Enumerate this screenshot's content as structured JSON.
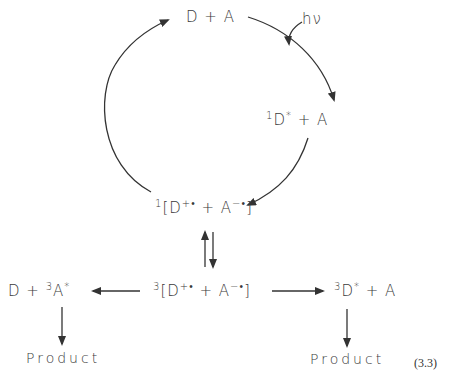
{
  "figure": {
    "equation_number": "(3.3)",
    "species": {
      "ground": {
        "main": "D + A"
      },
      "singlet_excited": {
        "pre": "1",
        "main": "D",
        "post": "*",
        "rest": " + A"
      },
      "singlet_rip": {
        "pre": "1",
        "open": "[D",
        "cation": "+•",
        "mid": " + A",
        "anion": "−•",
        "close": "]"
      },
      "triplet_rip": {
        "pre": "3",
        "open": "[D",
        "cation": "+•",
        "mid": " + A",
        "anion": "−•",
        "close": "]"
      },
      "triplet_acceptor": {
        "lead": "D + ",
        "pre": "3",
        "main": "A",
        "post": "*"
      },
      "triplet_donor": {
        "pre": "3",
        "main": "D",
        "post": "*",
        "rest": " + A"
      },
      "product_left": "Product",
      "product_right": "Product"
    },
    "labels": {
      "photon": "hν"
    },
    "arrows": [
      {
        "from": "D + A",
        "to": "1D* + A",
        "label": "hν",
        "style": "curved"
      },
      {
        "from": "1D* + A",
        "to": "1[D+• + A−•]",
        "style": "curved"
      },
      {
        "from": "1[D+• + A−•]",
        "to": "D + A",
        "style": "curved"
      },
      {
        "from": "1[D+• + A−•]",
        "to": "3[D+• + A−•]",
        "style": "equilibrium"
      },
      {
        "from": "3[D+• + A−•]",
        "to": "D + 3A*",
        "style": "straight"
      },
      {
        "from": "3[D+• + A−•]",
        "to": "3D* + A",
        "style": "straight"
      },
      {
        "from": "D + 3A*",
        "to": "Product",
        "style": "straight"
      },
      {
        "from": "3D* + A",
        "to": "Product",
        "style": "straight"
      }
    ]
  }
}
